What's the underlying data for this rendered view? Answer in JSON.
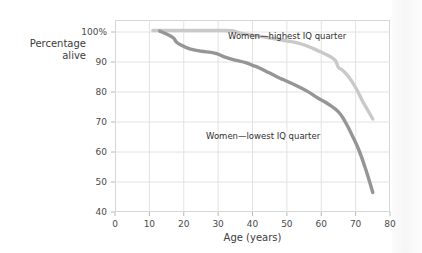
{
  "chart_data": {
    "type": "line",
    "title": "",
    "xlabel": "Age (years)",
    "ylabel": "Percentage alive",
    "ylabel_lines": [
      "Percentage",
      "alive"
    ],
    "xlim": [
      0,
      80
    ],
    "ylim": [
      40,
      104
    ],
    "grid": true,
    "legend_position": "inline-annotations",
    "xticks": [
      "0",
      "10",
      "20",
      "30",
      "40",
      "50",
      "60",
      "70",
      "80"
    ],
    "xtick_values": [
      0,
      10,
      20,
      30,
      40,
      50,
      60,
      70,
      80
    ],
    "yticks": [
      "40",
      "50",
      "60",
      "70",
      "80",
      "90",
      "100%"
    ],
    "ytick_values": [
      40,
      50,
      60,
      70,
      80,
      90,
      100
    ],
    "series": [
      {
        "name": "Women—highest IQ quarter",
        "color": "#c9c9c9",
        "annotation": "Women—highest IQ quarter",
        "x": [
          11,
          15,
          20,
          25,
          30,
          34,
          36,
          38,
          41,
          44,
          47,
          50,
          53,
          56,
          59,
          62,
          64,
          65,
          66,
          68,
          70,
          72,
          73.5,
          75
        ],
        "y": [
          100.5,
          100.5,
          100.5,
          100.5,
          100.5,
          100.4,
          99.8,
          99.3,
          98.8,
          98.2,
          97.6,
          97.0,
          96.4,
          95.3,
          93.8,
          92.2,
          90.6,
          88.2,
          87.4,
          85.0,
          81.5,
          77.0,
          74.0,
          71.0
        ]
      },
      {
        "name": "Women—lowest IQ quarter",
        "color": "#959595",
        "annotation": "Women—lowest IQ quarter",
        "x": [
          13,
          15,
          17,
          18,
          20,
          22,
          25,
          28,
          30,
          32,
          35,
          38,
          40,
          42,
          45,
          48,
          50,
          53,
          56,
          59,
          62,
          65,
          67,
          69,
          71,
          73,
          75
        ],
        "y": [
          100.3,
          99.3,
          98.0,
          96.5,
          95.2,
          94.3,
          93.6,
          93.2,
          92.6,
          91.6,
          90.6,
          89.8,
          88.9,
          88.0,
          86.3,
          84.6,
          83.6,
          82.0,
          80.2,
          78.0,
          76.0,
          73.4,
          70.0,
          65.5,
          60.5,
          54.0,
          46.5
        ]
      }
    ]
  }
}
